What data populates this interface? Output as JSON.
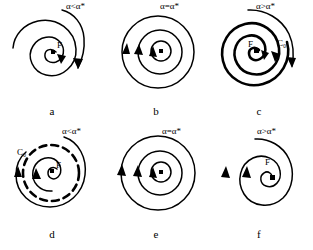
{
  "figure": {
    "title": "",
    "background_color": "#ffffff",
    "ink_color": "#000000",
    "layout": "2 rows x 3 columns of phase portraits",
    "panels": [
      {
        "id": "a",
        "caption": "a",
        "param_label": "α<α*",
        "fixed_point_label": "F",
        "cycle_label": "",
        "type": "stable-focus-inward-spiral",
        "description": "trajectory spirals inward to stable focus F"
      },
      {
        "id": "b",
        "caption": "b",
        "param_label": "α=α*",
        "fixed_point_label": "",
        "cycle_label": "",
        "type": "center-concentric-closed-orbits",
        "description": "closed concentric orbits at critical parameter"
      },
      {
        "id": "c",
        "caption": "c",
        "param_label": "α>α*",
        "fixed_point_label": "F",
        "cycle_label": "C₀",
        "type": "unstable-focus-stable-limit-cycle",
        "description": "unstable focus F, trajectories approach stable limit cycle C0"
      },
      {
        "id": "d",
        "caption": "d",
        "param_label": "α<α*",
        "fixed_point_label": "F",
        "cycle_label": "C₀",
        "type": "stable-focus-unstable-limit-cycle",
        "description": "stable focus F surrounded by unstable (dashed) limit cycle C0"
      },
      {
        "id": "e",
        "caption": "e",
        "param_label": "α=α*",
        "fixed_point_label": "",
        "cycle_label": "",
        "type": "center-concentric-closed-orbits",
        "description": "closed concentric orbits at critical parameter"
      },
      {
        "id": "f",
        "caption": "f",
        "param_label": "α>α*",
        "fixed_point_label": "F",
        "cycle_label": "",
        "type": "unstable-focus-outward-spiral",
        "description": "trajectory spirals outward from unstable focus F"
      }
    ]
  }
}
